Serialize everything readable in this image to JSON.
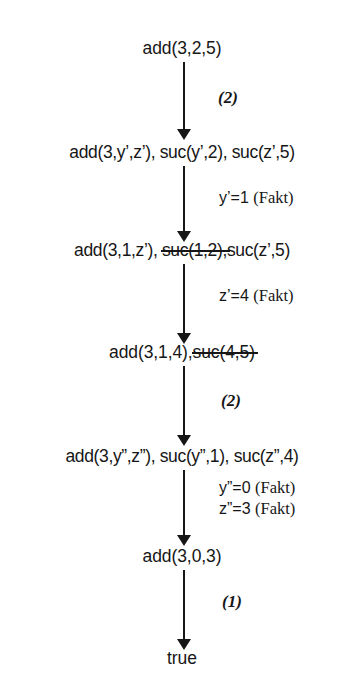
{
  "diagram": {
    "type": "proof-derivation-tree",
    "title": "",
    "background_color": "#ffffff",
    "ink_color": "#161616",
    "axis_x_center": 184,
    "nodes": [
      {
        "id": "n1",
        "text": "add(3,2,5)",
        "parts": [
          {
            "text": "add(3,2,5)",
            "struck": false
          }
        ],
        "y": 48
      },
      {
        "id": "n2",
        "text": "add(3,y’,z’), suc(y’,2), suc(z’,5)",
        "parts": [
          {
            "text": "add(3,y’,z’), suc(y’,2), suc(z’,5)",
            "struck": false
          }
        ],
        "y": 152
      },
      {
        "id": "n3",
        "text": "add(3,1,z’), suc(1,2),suc(z’,5)",
        "parts": [
          {
            "text": "add(3,1,z’), ",
            "struck": false
          },
          {
            "text": "suc(1,2),",
            "struck": true
          },
          {
            "text": "suc(z’,5)",
            "struck": false
          }
        ],
        "y": 250
      },
      {
        "id": "n4",
        "text": "add(3,1,4),suc(4,5)",
        "parts": [
          {
            "text": "add(3,1,4),",
            "struck": false
          },
          {
            "text": "suc(4,5)",
            "struck": true
          }
        ],
        "y": 352
      },
      {
        "id": "n5",
        "text": "add(3,y”,z”), suc(y”,1), suc(z”,4)",
        "parts": [
          {
            "text": "add(3,y”,z”), suc(y”,1), suc(z”,4)",
            "struck": false
          }
        ],
        "y": 456
      },
      {
        "id": "n6",
        "text": "add(3,0,3)",
        "parts": [
          {
            "text": "add(3,0,3)",
            "struck": false
          }
        ],
        "y": 556
      },
      {
        "id": "n7",
        "text": "true",
        "parts": [
          {
            "text": "true",
            "struck": false
          }
        ],
        "y": 658
      }
    ],
    "edges": [
      {
        "id": "e1",
        "from": "n1",
        "to": "n2",
        "label": "(2)",
        "label_kind": "rule"
      },
      {
        "id": "e2",
        "from": "n2",
        "to": "n3",
        "label": "y’=1 (Fakt)",
        "label_kind": "subst",
        "label_value": "y’=1",
        "label_note": "(Fakt)"
      },
      {
        "id": "e3",
        "from": "n3",
        "to": "n4",
        "label": "z’=4 (Fakt)",
        "label_kind": "subst",
        "label_value": "z’=4",
        "label_note": "(Fakt)"
      },
      {
        "id": "e4",
        "from": "n4",
        "to": "n5",
        "label": "(2)",
        "label_kind": "rule"
      },
      {
        "id": "e5",
        "from": "n5",
        "to": "n6",
        "label": "y”=0 (Fakt)",
        "label_kind": "subst",
        "label_value": "y”=0",
        "label_note": "(Fakt)",
        "label2": "z”=3 (Fakt)",
        "label2_value": "z”=3",
        "label2_note": "(Fakt)"
      },
      {
        "id": "e6",
        "from": "n6",
        "to": "n7",
        "label": "(1)",
        "label_kind": "rule"
      }
    ]
  },
  "labels": {
    "rule2_a": "(2)",
    "subst_y1": "y’=1",
    "subst_y1_note": "(Fakt)",
    "subst_z4": "z’=4",
    "subst_z4_note": "(Fakt)",
    "rule2_b": "(2)",
    "subst_y0": "y”=0",
    "subst_y0_note": "(Fakt)",
    "subst_z3": "z”=3",
    "subst_z3_note": "(Fakt)",
    "rule1": "(1)"
  },
  "nodes_text": {
    "n1": "add(3,2,5)",
    "n2": "add(3,y’,z’), suc(y’,2), suc(z’,5)",
    "n3_a": "add(3,1,z’), ",
    "n3_b": "suc(1,2),",
    "n3_c": "suc(z’,5)",
    "n4_a": "add(3,1,4),",
    "n4_b": "suc(4,5)",
    "n5": "add(3,y”,z”), suc(y”,1), suc(z”,4)",
    "n6": "add(3,0,3)",
    "n7": "true"
  }
}
